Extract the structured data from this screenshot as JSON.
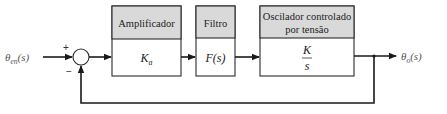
{
  "diagram": {
    "type": "feedback-control-block-diagram",
    "input": {
      "symbol": "θ",
      "subscript": "en",
      "argument": "(s)"
    },
    "output": {
      "symbol": "θ",
      "subscript": "o",
      "argument": "(s)"
    },
    "summing_junction": {
      "plus_sign": "+",
      "minus_sign": "−"
    },
    "blocks": [
      {
        "header": "Amplificador",
        "transfer_function": {
          "symbol": "K",
          "subscript": "a"
        }
      },
      {
        "header": "Filtro",
        "transfer_function": {
          "text": "F(s)"
        }
      },
      {
        "header_line1": "Oscilador controlado",
        "header_line2": "por tensão",
        "transfer_function": {
          "numerator": "K",
          "denominator": "s"
        }
      }
    ],
    "feedback": "unity negative feedback from output to summing junction"
  }
}
